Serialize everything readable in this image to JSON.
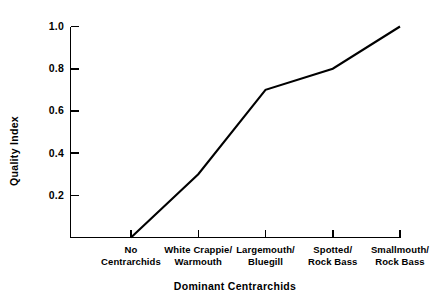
{
  "chart_data": {
    "type": "line",
    "title": "",
    "xlabel": "Dominant Centrarchids",
    "ylabel": "Quality Index",
    "categories": [
      "No\nCentrarchids",
      "White Crappie/\nWarmouth",
      "Largemouth/\nBluegill",
      "Spotted/\nRock Bass",
      "Smallmouth/\nRock Bass"
    ],
    "category_lines": [
      [
        "No",
        "Centrarchids"
      ],
      [
        "White Crappie/",
        "Warmouth"
      ],
      [
        "Largemouth/",
        "Bluegill"
      ],
      [
        "Spotted/",
        "Rock Bass"
      ],
      [
        "Smallmouth/",
        "Rock Bass"
      ]
    ],
    "values": [
      0.0,
      0.3,
      0.7,
      0.8,
      1.0
    ],
    "ylim": [
      0.0,
      1.0
    ],
    "ytick_labels": [
      "1.0",
      "0.8",
      "0.6",
      "0.4",
      "0.2"
    ],
    "ytick_values": [
      1.0,
      0.8,
      0.6,
      0.4,
      0.2
    ],
    "grid": false,
    "legend": null,
    "line_color": "#000000",
    "background_color": "#ffffff"
  },
  "axis": {
    "y_label_text": "Quality Index",
    "x_label_text": "Dominant Centrarchids"
  }
}
